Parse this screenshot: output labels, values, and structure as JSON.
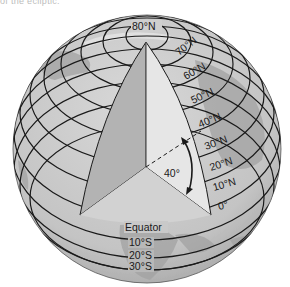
{
  "figure": {
    "caption_fragment": "of the ecliptic.",
    "angle_label": "40°",
    "equator_label": "Equator",
    "north_labels": [
      {
        "text": "80°N",
        "x": 146,
        "y": 30
      },
      {
        "text": "70°N",
        "x": 191,
        "y": 53
      },
      {
        "text": "60°N",
        "x": 196,
        "y": 76
      },
      {
        "text": "50°N",
        "x": 204,
        "y": 99
      },
      {
        "text": "40°N",
        "x": 210,
        "y": 122
      },
      {
        "text": "30°N",
        "x": 214,
        "y": 144
      },
      {
        "text": "20°N",
        "x": 219,
        "y": 164
      },
      {
        "text": "10°N",
        "x": 222,
        "y": 184
      },
      {
        "text": "0°",
        "x": 226,
        "y": 204
      }
    ],
    "south_labels": [
      {
        "text": "10°S",
        "x": 137,
        "y": 246
      },
      {
        "text": "20°S",
        "x": 137,
        "y": 259
      },
      {
        "text": "30°S",
        "x": 137,
        "y": 270
      }
    ],
    "colors": {
      "globe_fill": "#c9c9c9",
      "globe_land": "#a9a9a9",
      "wedge_left": "#b3b3b3",
      "wedge_right": "#e6e6e6",
      "wedge_bottom": "#d4d4d4",
      "line": "#1a1a1a"
    }
  }
}
